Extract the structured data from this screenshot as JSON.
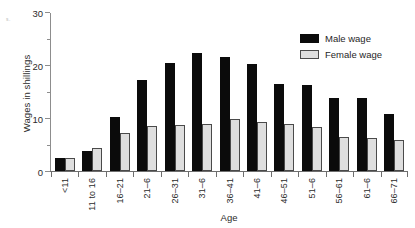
{
  "chart_data": {
    "type": "bar",
    "title": "",
    "xlabel": "Age",
    "ylabel": "Wages in shillings",
    "ylim": [
      0,
      30
    ],
    "ytick_labels": [
      "0",
      "10",
      "20",
      "30"
    ],
    "ytick_values": [
      0,
      10,
      20,
      30
    ],
    "yminor_values": [
      5,
      15,
      25
    ],
    "grid": false,
    "legend_position": "top-right",
    "categories": [
      "<11",
      "11 to 16",
      "16–21",
      "21–6",
      "26–31",
      "31–6",
      "36–41",
      "41–6",
      "46–51",
      "51–6",
      "56–61",
      "61–6",
      "66–71"
    ],
    "series": [
      {
        "name": "Male wage",
        "color": "#0b0b0b",
        "values": [
          2.5,
          3.8,
          10.3,
          17.2,
          20.5,
          22.5,
          21.6,
          20.3,
          16.6,
          16.4,
          13.8,
          13.8,
          10.9
        ]
      },
      {
        "name": "Female wage",
        "color": "#dedede",
        "values": [
          2.5,
          4.3,
          7.3,
          8.6,
          8.8,
          9.0,
          9.8,
          9.4,
          8.9,
          8.4,
          6.5,
          6.2,
          5.9
        ]
      }
    ]
  },
  "legend": {
    "items": [
      {
        "label": "Male wage"
      },
      {
        "label": "Female wage"
      }
    ]
  },
  "artifact": {
    "mark": "s."
  }
}
